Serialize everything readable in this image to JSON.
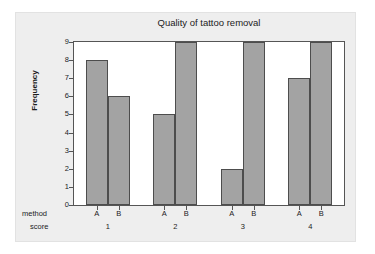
{
  "chart_data": {
    "type": "bar",
    "title": "Quality of tattoo removal",
    "xlabel": "",
    "ylabel": "Frequency",
    "ylim": [
      0,
      9
    ],
    "yticks": [
      0,
      1,
      2,
      3,
      4,
      5,
      6,
      7,
      8,
      9
    ],
    "grid": false,
    "legend": "none",
    "row_headers": [
      "method",
      "score"
    ],
    "categories": [
      "1",
      "2",
      "3",
      "4"
    ],
    "subcategories": [
      "A",
      "B"
    ],
    "series": [
      {
        "name": "A",
        "values": [
          8,
          5,
          2,
          7
        ]
      },
      {
        "name": "B",
        "values": [
          6,
          9,
          9,
          9
        ]
      }
    ],
    "bars": [
      {
        "score": "1",
        "method": "A",
        "value": 8
      },
      {
        "score": "1",
        "method": "B",
        "value": 6
      },
      {
        "score": "2",
        "method": "A",
        "value": 5
      },
      {
        "score": "2",
        "method": "B",
        "value": 9
      },
      {
        "score": "3",
        "method": "A",
        "value": 2
      },
      {
        "score": "3",
        "method": "B",
        "value": 9
      },
      {
        "score": "4",
        "method": "A",
        "value": 7
      },
      {
        "score": "4",
        "method": "B",
        "value": 9
      }
    ],
    "colors": {
      "bar_fill": "#a3a3a3",
      "bar_edge": "#4d4d4d",
      "panel_background": "#eeeeee",
      "plot_background": "#ffffff",
      "axis": "#555555",
      "text": "#1c1c1c"
    }
  }
}
